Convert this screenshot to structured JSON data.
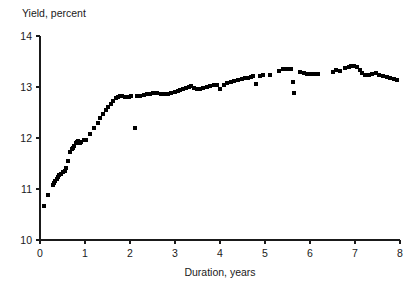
{
  "chart_data": {
    "type": "scatter",
    "title": "",
    "ylabel": "Yield, percent",
    "xlabel": "Duration, years",
    "xlim": [
      0,
      8
    ],
    "ylim": [
      10,
      14
    ],
    "xticks": [
      0,
      1,
      2,
      3,
      4,
      5,
      6,
      7,
      8
    ],
    "xticklabels": [
      "0",
      "1",
      "2",
      "3",
      "4",
      "5",
      "6",
      "7",
      "8"
    ],
    "yticks": [
      10,
      11,
      12,
      13,
      14
    ],
    "yticklabels": [
      "10",
      "11",
      "12",
      "13",
      "14"
    ],
    "grid": false,
    "legend": null,
    "marker": "square",
    "marker_color": "#000000",
    "marker_size_px": 4,
    "series": [
      {
        "name": "yield curve observations",
        "points": [
          [
            0.08,
            10.66
          ],
          [
            0.17,
            10.89
          ],
          [
            0.28,
            11.08
          ],
          [
            0.31,
            11.12
          ],
          [
            0.34,
            11.16
          ],
          [
            0.37,
            11.2
          ],
          [
            0.4,
            11.24
          ],
          [
            0.43,
            11.28
          ],
          [
            0.46,
            11.3
          ],
          [
            0.5,
            11.33
          ],
          [
            0.55,
            11.36
          ],
          [
            0.58,
            11.42
          ],
          [
            0.62,
            11.55
          ],
          [
            0.66,
            11.72
          ],
          [
            0.7,
            11.78
          ],
          [
            0.73,
            11.8
          ],
          [
            0.76,
            11.84
          ],
          [
            0.79,
            11.9
          ],
          [
            0.82,
            11.93
          ],
          [
            0.85,
            11.95
          ],
          [
            0.88,
            11.9
          ],
          [
            0.92,
            11.92
          ],
          [
            0.97,
            11.96
          ],
          [
            1.02,
            11.97
          ],
          [
            1.12,
            12.08
          ],
          [
            1.2,
            12.2
          ],
          [
            1.28,
            12.3
          ],
          [
            1.34,
            12.4
          ],
          [
            1.4,
            12.47
          ],
          [
            1.46,
            12.55
          ],
          [
            1.52,
            12.6
          ],
          [
            1.58,
            12.66
          ],
          [
            1.63,
            12.72
          ],
          [
            1.68,
            12.78
          ],
          [
            1.73,
            12.8
          ],
          [
            1.78,
            12.82
          ],
          [
            1.83,
            12.82
          ],
          [
            1.88,
            12.8
          ],
          [
            1.93,
            12.8
          ],
          [
            1.98,
            12.81
          ],
          [
            2.03,
            12.82
          ],
          [
            2.1,
            12.2
          ],
          [
            2.16,
            12.82
          ],
          [
            2.22,
            12.83
          ],
          [
            2.3,
            12.84
          ],
          [
            2.38,
            12.86
          ],
          [
            2.45,
            12.87
          ],
          [
            2.52,
            12.88
          ],
          [
            2.6,
            12.88
          ],
          [
            2.68,
            12.86
          ],
          [
            2.76,
            12.86
          ],
          [
            2.84,
            12.87
          ],
          [
            2.92,
            12.88
          ],
          [
            3.0,
            12.9
          ],
          [
            3.06,
            12.92
          ],
          [
            3.12,
            12.94
          ],
          [
            3.18,
            12.97
          ],
          [
            3.24,
            12.99
          ],
          [
            3.3,
            13.0
          ],
          [
            3.36,
            13.01
          ],
          [
            3.42,
            12.99
          ],
          [
            3.48,
            12.97
          ],
          [
            3.55,
            12.96
          ],
          [
            3.62,
            12.98
          ],
          [
            3.7,
            13.0
          ],
          [
            3.78,
            13.02
          ],
          [
            3.86,
            13.04
          ],
          [
            3.94,
            13.03
          ],
          [
            4.0,
            12.96
          ],
          [
            4.08,
            13.04
          ],
          [
            4.16,
            13.07
          ],
          [
            4.24,
            13.1
          ],
          [
            4.32,
            13.12
          ],
          [
            4.4,
            13.14
          ],
          [
            4.48,
            13.16
          ],
          [
            4.56,
            13.17
          ],
          [
            4.62,
            13.18
          ],
          [
            4.68,
            13.2
          ],
          [
            4.74,
            13.21
          ],
          [
            4.8,
            13.06
          ],
          [
            4.88,
            13.22
          ],
          [
            4.96,
            13.23
          ],
          [
            5.12,
            13.24
          ],
          [
            5.3,
            13.32
          ],
          [
            5.4,
            13.35
          ],
          [
            5.46,
            13.36
          ],
          [
            5.52,
            13.36
          ],
          [
            5.58,
            13.35
          ],
          [
            5.62,
            13.1
          ],
          [
            5.64,
            12.88
          ],
          [
            5.78,
            13.3
          ],
          [
            5.86,
            13.27
          ],
          [
            5.94,
            13.26
          ],
          [
            6.02,
            13.26
          ],
          [
            6.1,
            13.26
          ],
          [
            6.18,
            13.26
          ],
          [
            6.5,
            13.3
          ],
          [
            6.58,
            13.33
          ],
          [
            6.66,
            13.32
          ],
          [
            6.78,
            13.38
          ],
          [
            6.86,
            13.4
          ],
          [
            6.92,
            13.42
          ],
          [
            6.98,
            13.42
          ],
          [
            7.04,
            13.4
          ],
          [
            7.1,
            13.34
          ],
          [
            7.16,
            13.28
          ],
          [
            7.22,
            13.24
          ],
          [
            7.3,
            13.24
          ],
          [
            7.38,
            13.26
          ],
          [
            7.46,
            13.27
          ],
          [
            7.54,
            13.24
          ],
          [
            7.62,
            13.22
          ],
          [
            7.7,
            13.2
          ],
          [
            7.78,
            13.18
          ],
          [
            7.86,
            13.16
          ],
          [
            7.94,
            13.14
          ]
        ]
      }
    ]
  }
}
